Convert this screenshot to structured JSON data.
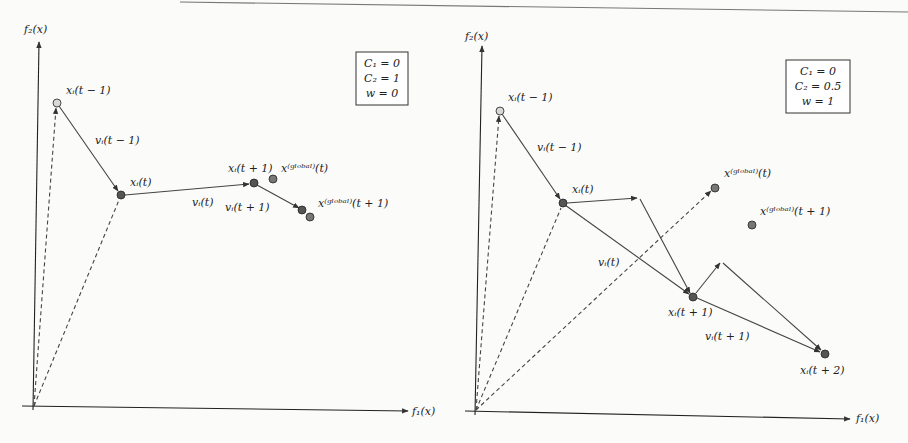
{
  "figure": {
    "top_rule": true,
    "panels": [
      {
        "id": "left",
        "axes": {
          "x_label": "f₁(x)",
          "y_label": "f₂(x)"
        },
        "params_box": [
          "C₁ = 0",
          "C₂ = 1",
          "w = 0"
        ],
        "points": [
          {
            "id": "xi_t_minus_1",
            "label": "xᵢ(t − 1)",
            "fill": "#d8d8d8"
          },
          {
            "id": "xi_t",
            "label": "xᵢ(t)",
            "fill": "#555555"
          },
          {
            "id": "xi_t_plus_1",
            "label": "xᵢ(t + 1)",
            "fill": "#555555"
          },
          {
            "id": "xglobal_t",
            "label": "x⁽ᵍˡᵒᵇᵃˡ⁾(t)",
            "fill": "#777777"
          },
          {
            "id": "xi_t_plus_2",
            "label": "",
            "fill": "#555555"
          },
          {
            "id": "xglobal_t_plus_1",
            "label": "x⁽ᵍˡᵒᵇᵃˡ⁾(t + 1)",
            "fill": "#777777"
          }
        ],
        "vectors": [
          {
            "id": "v_t_minus_1",
            "label": "vᵢ(t − 1)"
          },
          {
            "id": "v_t",
            "label": "vᵢ(t)"
          },
          {
            "id": "v_t_plus_1",
            "label": "vᵢ(t + 1)"
          }
        ]
      },
      {
        "id": "right",
        "axes": {
          "x_label": "f₁(x)",
          "y_label": "f₂(x)"
        },
        "params_box": [
          "C₁ = 0",
          "C₂ = 0.5",
          "w = 1"
        ],
        "points": [
          {
            "id": "xi_t_minus_1",
            "label": "xᵢ(t − 1)",
            "fill": "#d8d8d8"
          },
          {
            "id": "xi_t",
            "label": "xᵢ(t)",
            "fill": "#555555"
          },
          {
            "id": "xglobal_t",
            "label": "x⁽ᵍˡᵒᵇᵃˡ⁾(t)",
            "fill": "#777777"
          },
          {
            "id": "xglobal_t_plus_1",
            "label": "x⁽ᵍˡᵒᵇᵃˡ⁾(t + 1)",
            "fill": "#777777"
          },
          {
            "id": "xi_t_plus_1",
            "label": "xᵢ(t + 1)",
            "fill": "#555555"
          },
          {
            "id": "xi_t_plus_2",
            "label": "xᵢ(t + 2)",
            "fill": "#555555"
          }
        ],
        "vectors": [
          {
            "id": "v_t_minus_1",
            "label": "vᵢ(t − 1)"
          },
          {
            "id": "v_t",
            "label": "vᵢ(t)"
          },
          {
            "id": "v_t_plus_1",
            "label": "vᵢ(t + 1)"
          }
        ]
      }
    ]
  }
}
